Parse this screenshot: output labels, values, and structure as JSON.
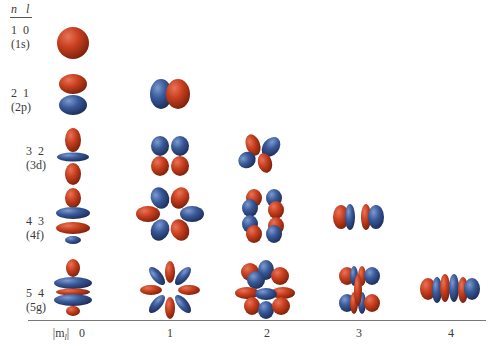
{
  "header": {
    "n_label": "n",
    "l_label": "l"
  },
  "rows": [
    {
      "n": "1",
      "l": "0",
      "name": "(1s)"
    },
    {
      "n": "2",
      "l": "1",
      "name": "(2p)"
    },
    {
      "n": "3",
      "l": "2",
      "name": "(3d)"
    },
    {
      "n": "4",
      "l": "3",
      "name": "(4f)"
    },
    {
      "n": "5",
      "l": "4",
      "name": "(5g)"
    }
  ],
  "axis": {
    "label": "|m",
    "label_sub": "l",
    "label_suffix": "|",
    "ticks": [
      "0",
      "1",
      "2",
      "3",
      "4"
    ]
  },
  "colors": {
    "positive_lobe": "#c8401e",
    "negative_lobe": "#3a5a9a",
    "axis": "#777777"
  },
  "orbitals": [
    {
      "row": "1s",
      "ml": [
        0
      ]
    },
    {
      "row": "2p",
      "ml": [
        0,
        1
      ]
    },
    {
      "row": "3d",
      "ml": [
        0,
        1,
        2
      ]
    },
    {
      "row": "4f",
      "ml": [
        0,
        1,
        2,
        3
      ]
    },
    {
      "row": "5g",
      "ml": [
        0,
        1,
        2,
        3,
        4
      ]
    }
  ]
}
